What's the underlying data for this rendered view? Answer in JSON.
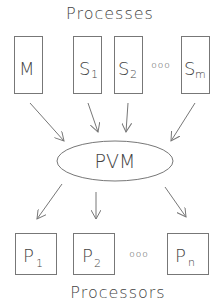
{
  "diagram": {
    "top_title": "Processes",
    "bottom_title": "Processors",
    "center": {
      "label": "PVM"
    },
    "processes": [
      {
        "main": "M",
        "sub": ""
      },
      {
        "main": "S",
        "sub": "1"
      },
      {
        "main": "S",
        "sub": "2"
      },
      {
        "main": "S",
        "sub": "m"
      }
    ],
    "process_ellipsis": "ooo",
    "processors": [
      {
        "main": "P",
        "sub": "1"
      },
      {
        "main": "P",
        "sub": "2"
      },
      {
        "main": "P",
        "sub": "n"
      }
    ],
    "processor_ellipsis": "ooo",
    "colors": {
      "stroke": "#777777",
      "text": "#444444",
      "background": "#ffffff"
    }
  }
}
